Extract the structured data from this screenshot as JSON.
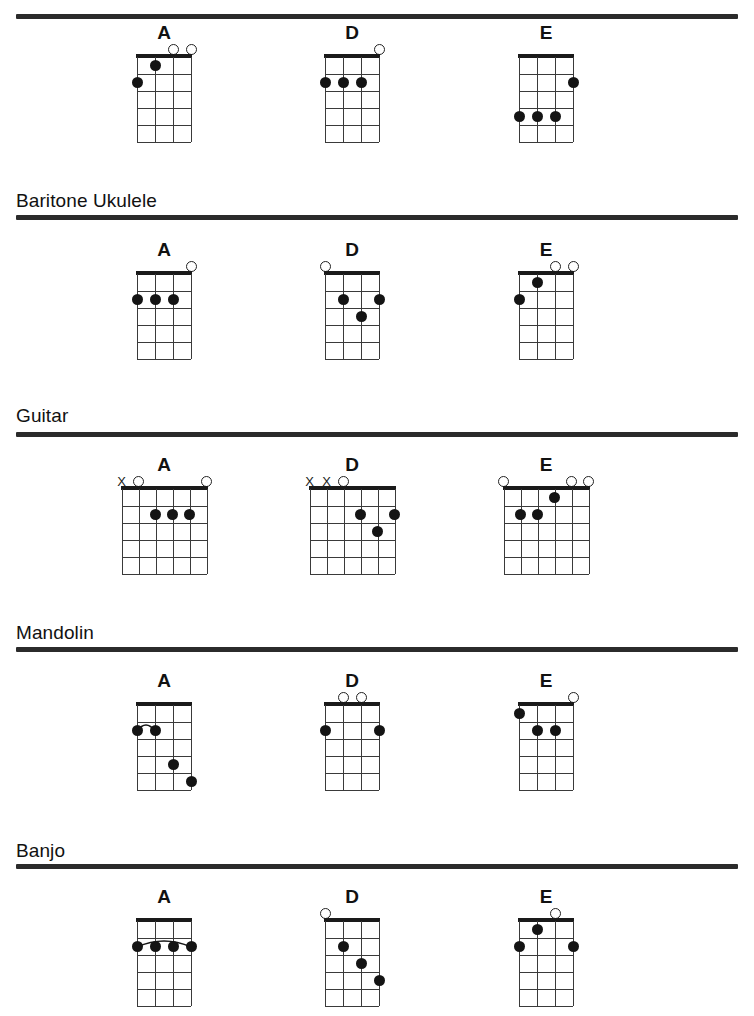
{
  "page": {
    "top_rule": true
  },
  "colors": {
    "rule": "#2b2b2b",
    "grid": "#3a3a3a",
    "nut": "#1a1a1a",
    "dot": "#141414",
    "text": "#111111"
  },
  "chord_data": {
    "type": "diagram",
    "chords_per_section": [
      "A",
      "D",
      "E"
    ],
    "marker_symbols": {
      "open": "O",
      "mute": "X"
    },
    "sections": [
      {
        "label": "",
        "label_visible": false,
        "strings": 4,
        "frets": 5,
        "chords": [
          {
            "name": "A",
            "markers": [
              "",
              "",
              "open",
              "open"
            ],
            "dots": [
              {
                "string": 1,
                "fret": 2
              },
              {
                "string": 2,
                "fret": 1
              }
            ],
            "barre": null
          },
          {
            "name": "D",
            "markers": [
              "",
              "",
              "",
              "open"
            ],
            "dots": [
              {
                "string": 1,
                "fret": 2
              },
              {
                "string": 2,
                "fret": 2
              },
              {
                "string": 3,
                "fret": 2
              }
            ],
            "barre": null
          },
          {
            "name": "E",
            "markers": [
              "",
              "",
              "",
              ""
            ],
            "dots": [
              {
                "string": 1,
                "fret": 4
              },
              {
                "string": 2,
                "fret": 4
              },
              {
                "string": 3,
                "fret": 4
              },
              {
                "string": 4,
                "fret": 2
              }
            ],
            "barre": null
          }
        ]
      },
      {
        "label": "Baritone Ukulele",
        "label_visible": true,
        "strings": 4,
        "frets": 5,
        "chords": [
          {
            "name": "A",
            "markers": [
              "",
              "",
              "",
              "open"
            ],
            "dots": [
              {
                "string": 1,
                "fret": 2
              },
              {
                "string": 2,
                "fret": 2
              },
              {
                "string": 3,
                "fret": 2
              }
            ],
            "barre": null
          },
          {
            "name": "D",
            "markers": [
              "open",
              "",
              "",
              ""
            ],
            "dots": [
              {
                "string": 2,
                "fret": 2
              },
              {
                "string": 3,
                "fret": 3
              },
              {
                "string": 4,
                "fret": 2
              }
            ],
            "barre": null
          },
          {
            "name": "E",
            "markers": [
              "",
              "",
              "open",
              "open"
            ],
            "dots": [
              {
                "string": 1,
                "fret": 2
              },
              {
                "string": 2,
                "fret": 1
              }
            ],
            "barre": null
          }
        ]
      },
      {
        "label": "Guitar",
        "label_visible": true,
        "strings": 6,
        "frets": 5,
        "chords": [
          {
            "name": "A",
            "markers": [
              "mute",
              "open",
              "",
              "",
              "",
              "open"
            ],
            "dots": [
              {
                "string": 3,
                "fret": 2
              },
              {
                "string": 4,
                "fret": 2
              },
              {
                "string": 5,
                "fret": 2
              }
            ],
            "barre": null
          },
          {
            "name": "D",
            "markers": [
              "mute",
              "mute",
              "open",
              "",
              "",
              ""
            ],
            "dots": [
              {
                "string": 4,
                "fret": 2
              },
              {
                "string": 5,
                "fret": 3
              },
              {
                "string": 6,
                "fret": 2
              }
            ],
            "barre": null
          },
          {
            "name": "E",
            "markers": [
              "open",
              "",
              "",
              "",
              "open",
              "open"
            ],
            "dots": [
              {
                "string": 2,
                "fret": 2
              },
              {
                "string": 3,
                "fret": 2
              },
              {
                "string": 4,
                "fret": 1
              }
            ],
            "barre": null
          }
        ]
      },
      {
        "label": "Mandolin",
        "label_visible": true,
        "strings": 4,
        "frets": 5,
        "chords": [
          {
            "name": "A",
            "markers": [
              "",
              "",
              "",
              ""
            ],
            "dots": [
              {
                "string": 1,
                "fret": 2
              },
              {
                "string": 2,
                "fret": 2
              },
              {
                "string": 3,
                "fret": 4
              },
              {
                "string": 4,
                "fret": 5
              }
            ],
            "barre": {
              "fret": 2,
              "from_string": 1,
              "to_string": 2
            }
          },
          {
            "name": "D",
            "markers": [
              "",
              "open",
              "open",
              ""
            ],
            "dots": [
              {
                "string": 1,
                "fret": 2
              },
              {
                "string": 4,
                "fret": 2
              }
            ],
            "barre": null
          },
          {
            "name": "E",
            "markers": [
              "",
              "",
              "",
              "open"
            ],
            "dots": [
              {
                "string": 1,
                "fret": 1
              },
              {
                "string": 2,
                "fret": 2
              },
              {
                "string": 3,
                "fret": 2
              }
            ],
            "barre": null
          }
        ]
      },
      {
        "label": "Banjo",
        "label_visible": true,
        "strings": 4,
        "frets": 5,
        "chords": [
          {
            "name": "A",
            "markers": [
              "",
              "",
              "",
              ""
            ],
            "dots": [
              {
                "string": 1,
                "fret": 2
              },
              {
                "string": 2,
                "fret": 2
              },
              {
                "string": 3,
                "fret": 2
              },
              {
                "string": 4,
                "fret": 2
              }
            ],
            "barre": {
              "fret": 2,
              "from_string": 1,
              "to_string": 4
            }
          },
          {
            "name": "D",
            "markers": [
              "open",
              "",
              "",
              ""
            ],
            "dots": [
              {
                "string": 2,
                "fret": 2
              },
              {
                "string": 3,
                "fret": 3
              },
              {
                "string": 4,
                "fret": 4
              }
            ],
            "barre": null
          },
          {
            "name": "E",
            "markers": [
              "",
              "",
              "open",
              ""
            ],
            "dots": [
              {
                "string": 1,
                "fret": 2
              },
              {
                "string": 2,
                "fret": 1
              },
              {
                "string": 4,
                "fret": 2
              }
            ],
            "barre": null
          }
        ]
      }
    ]
  }
}
